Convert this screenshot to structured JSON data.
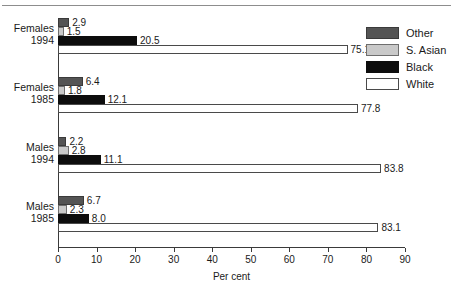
{
  "chart_data": {
    "type": "bar",
    "orientation": "horizontal",
    "title": "",
    "xlabel": "Per cent",
    "ylabel": "",
    "xlim": [
      0,
      90
    ],
    "xticks": [
      0,
      10,
      20,
      30,
      40,
      50,
      60,
      70,
      80,
      90
    ],
    "xtick_labels": [
      "0",
      "10",
      "20",
      "30",
      "40",
      "50",
      "60",
      "70",
      "80",
      "90"
    ],
    "grid": false,
    "legend_position": "top-right",
    "categories": [
      "Females 1994",
      "Females 1985",
      "Males 1994",
      "Males 1985"
    ],
    "category_lines": [
      [
        "Females",
        "1994"
      ],
      [
        "Females",
        "1985"
      ],
      [
        "Males",
        "1994"
      ],
      [
        "Males",
        "1985"
      ]
    ],
    "series": [
      {
        "name": "Other",
        "color": "#545454",
        "values": [
          2.9,
          6.4,
          2.2,
          6.7
        ]
      },
      {
        "name": "S. Asian",
        "color": "#c9c9c9",
        "values": [
          1.5,
          1.8,
          2.8,
          2.3
        ]
      },
      {
        "name": "Black",
        "color": "#0d0d0d",
        "values": [
          20.5,
          12.1,
          11.1,
          8.0
        ]
      },
      {
        "name": "White",
        "color": "#ffffff",
        "values": [
          75.1,
          77.8,
          83.8,
          83.1
        ]
      }
    ],
    "value_labels": [
      [
        "2.9",
        "1.5",
        "20.5",
        "75.1"
      ],
      [
        "6.4",
        "1.8",
        "12.1",
        "77.8"
      ],
      [
        "2.2",
        "2.8",
        "11.1",
        "83.8"
      ],
      [
        "6.7",
        "2.3",
        "8.0",
        "83.1"
      ]
    ]
  },
  "legend": {
    "items": [
      {
        "label": "Other",
        "swatch": "other"
      },
      {
        "label": "S. Asian",
        "swatch": "sasian"
      },
      {
        "label": "Black",
        "swatch": "black"
      },
      {
        "label": "White",
        "swatch": "white"
      }
    ]
  },
  "axis": {
    "x_label": "Per cent",
    "ticks": [
      "0",
      "10",
      "20",
      "30",
      "40",
      "50",
      "60",
      "70",
      "80",
      "90"
    ]
  },
  "groups": [
    {
      "line1": "Females",
      "line2": "1994",
      "bars": [
        {
          "series": "Other",
          "value": 2.9,
          "label": "2.9"
        },
        {
          "series": "S. Asian",
          "value": 1.5,
          "label": "1.5"
        },
        {
          "series": "Black",
          "value": 20.5,
          "label": "20.5"
        },
        {
          "series": "White",
          "value": 75.1,
          "label": "75.1"
        }
      ]
    },
    {
      "line1": "Females",
      "line2": "1985",
      "bars": [
        {
          "series": "Other",
          "value": 6.4,
          "label": "6.4"
        },
        {
          "series": "S. Asian",
          "value": 1.8,
          "label": "1.8"
        },
        {
          "series": "Black",
          "value": 12.1,
          "label": "12.1"
        },
        {
          "series": "White",
          "value": 77.8,
          "label": "77.8"
        }
      ]
    },
    {
      "line1": "Males",
      "line2": "1994",
      "bars": [
        {
          "series": "Other",
          "value": 2.2,
          "label": "2.2"
        },
        {
          "series": "S. Asian",
          "value": 2.8,
          "label": "2.8"
        },
        {
          "series": "Black",
          "value": 11.1,
          "label": "11.1"
        },
        {
          "series": "White",
          "value": 83.8,
          "label": "83.8"
        }
      ]
    },
    {
      "line1": "Males",
      "line2": "1985",
      "bars": [
        {
          "series": "Other",
          "value": 6.7,
          "label": "6.7"
        },
        {
          "series": "S. Asian",
          "value": 2.3,
          "label": "2.3"
        },
        {
          "series": "Black",
          "value": 8.0,
          "label": "8.0"
        },
        {
          "series": "White",
          "value": 83.1,
          "label": "83.1"
        }
      ]
    }
  ]
}
